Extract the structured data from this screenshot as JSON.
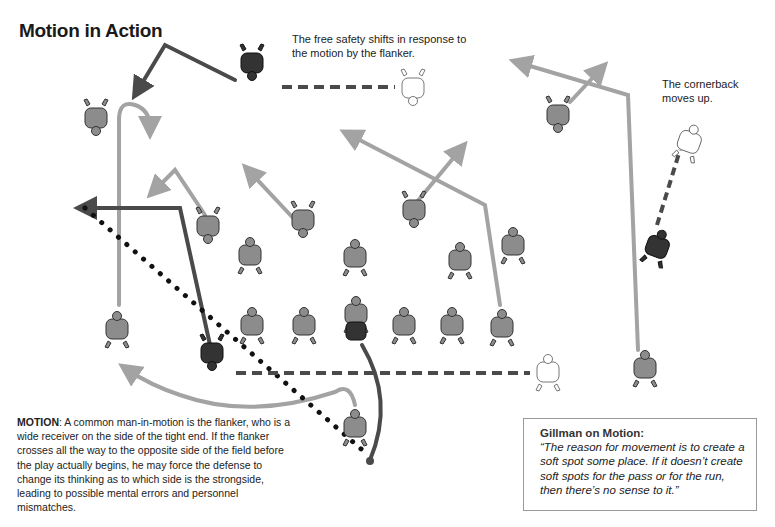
{
  "title": "Motion in Action",
  "captions": {
    "free_safety": "The free safety shifts in response to the motion by the flanker.",
    "cornerback": "The cornerback moves up."
  },
  "motion_text": {
    "lead": "MOTION",
    "separator": ": ",
    "body": "A common man-in-motion is the flanker, who is a wide receiver on the side of the tight end. If the flanker crosses all the way to the opposite side of the field before the play actually begins, he may force the defense to change its thinking as to which side is the strongside, leading to possible mental errors and personnel mismatches."
  },
  "quote": {
    "heading": "Gillman on Motion:",
    "body": "“The reason for movement is to create a soft spot some place. If it doesn’t create soft spots for the pass or for the run, then there’s no sense to it.”"
  },
  "colors": {
    "route_light": "#a3a3a3",
    "route_dark": "#4a4a4a",
    "player_gray": "#8c8c8c",
    "player_dark": "#333333",
    "player_outline": "#ffffff"
  },
  "players": {
    "offense_line": [
      "75",
      "66",
      "58",
      "64",
      "73",
      "87"
    ],
    "defense": [
      "19",
      "51",
      "53",
      "57",
      "55",
      "92",
      "85"
    ],
    "wide_left": "82",
    "flanker": "86",
    "split_right": "88",
    "top_left_db": "18",
    "top_right_db": "24",
    "free_safety": "12",
    "cornerback": "26"
  }
}
